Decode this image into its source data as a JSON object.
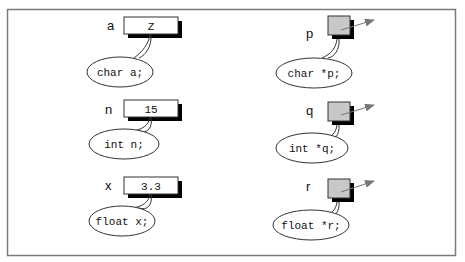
{
  "diagram": {
    "frame_color": "#7a7a7a",
    "value_box_fill": "#ffffff",
    "pointer_box_fill": "#c8c8c8",
    "shadow_color": "#000000",
    "arrow_color": "#777777",
    "variables": [
      {
        "name": "a",
        "value": "Z",
        "declaration": "char a;"
      },
      {
        "name": "n",
        "value": "15",
        "declaration": "int n;"
      },
      {
        "name": "x",
        "value": "3.3",
        "declaration": "float x;"
      }
    ],
    "pointers": [
      {
        "name": "p",
        "declaration": "char *p;"
      },
      {
        "name": "q",
        "declaration": "int *q;"
      },
      {
        "name": "r",
        "declaration": "float *r;"
      }
    ]
  }
}
